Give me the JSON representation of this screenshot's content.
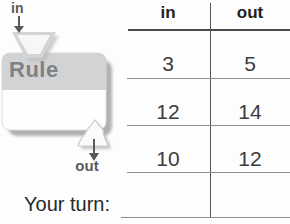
{
  "machine": {
    "in_label": "in",
    "rule_label": "Rule",
    "out_label": "out"
  },
  "table": {
    "in_header": "in",
    "out_header": "out",
    "rows": [
      {
        "in": "3",
        "out": "5"
      },
      {
        "in": "12",
        "out": "14"
      },
      {
        "in": "10",
        "out": "12"
      },
      {
        "in": "",
        "out": ""
      }
    ]
  },
  "prompt": {
    "your_turn_label": "Your turn:"
  },
  "colors": {
    "label_gray": "#5a5b5e",
    "rule_text_gray": "#7f8184",
    "machine_band_gray": "#d2d3d5",
    "machine_shadow": "#aeb0b2",
    "header_rule": "#4a4b4d",
    "row_rule": "#8b8d90",
    "table_text": "#3b3c3e",
    "header_text": "#1f1f21"
  }
}
